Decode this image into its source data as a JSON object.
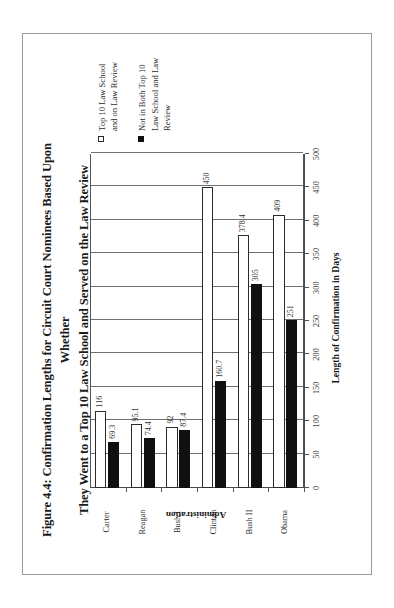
{
  "figure": {
    "title_line1": "Figure 4.4: Confirmation Lengths for Circuit Court Nominees Based Upon Whether",
    "title_line2": "They Went to a Top 10 Law School and Served on the Law Review"
  },
  "chart_data": {
    "type": "bar",
    "orientation": "vertical",
    "title": "Figure 4.4: Confirmation Lengths for Circuit Court Nominees Based Upon Whether They Went to a Top 10 Law School and Served on the Law Review",
    "xlabel": "Administration",
    "ylabel": "Length of Confirmation in Days",
    "ylim": [
      0,
      500
    ],
    "yticks": [
      0,
      50,
      100,
      150,
      200,
      250,
      300,
      350,
      400,
      450,
      500
    ],
    "ytick_labels": [
      "0",
      "50",
      "100",
      "150",
      "200",
      "250",
      "300",
      "350",
      "400",
      "450",
      "500"
    ],
    "grid": true,
    "legend_position": "right",
    "categories": [
      "Carter",
      "Reagan",
      "Bush I",
      "Clinton",
      "Bush II",
      "Obama"
    ],
    "series": [
      {
        "name": "Top 10 Law School and on Law Review",
        "color": "#ffffff",
        "edge_color": "#2b2b2b",
        "values": [
          116,
          95.1,
          92,
          450,
          378.4,
          409
        ],
        "labels": [
          "116",
          "95.1",
          "92",
          "450",
          "378.4",
          "409"
        ]
      },
      {
        "name": "Not in Both Top 10 Law School and Law Review",
        "color": "#101010",
        "edge_color": "#101010",
        "values": [
          69.3,
          74.4,
          87.4,
          160.7,
          305,
          251
        ],
        "labels": [
          "69.3",
          "74.4",
          "87.4",
          "160.7",
          "305",
          "251"
        ]
      }
    ]
  },
  "legend": {
    "entries": [
      {
        "label": "Top 10 Law School and on Law Review",
        "swatch": "white"
      },
      {
        "label": "Not in Both Top 10 Law School and Law Review",
        "swatch": "black"
      }
    ]
  }
}
